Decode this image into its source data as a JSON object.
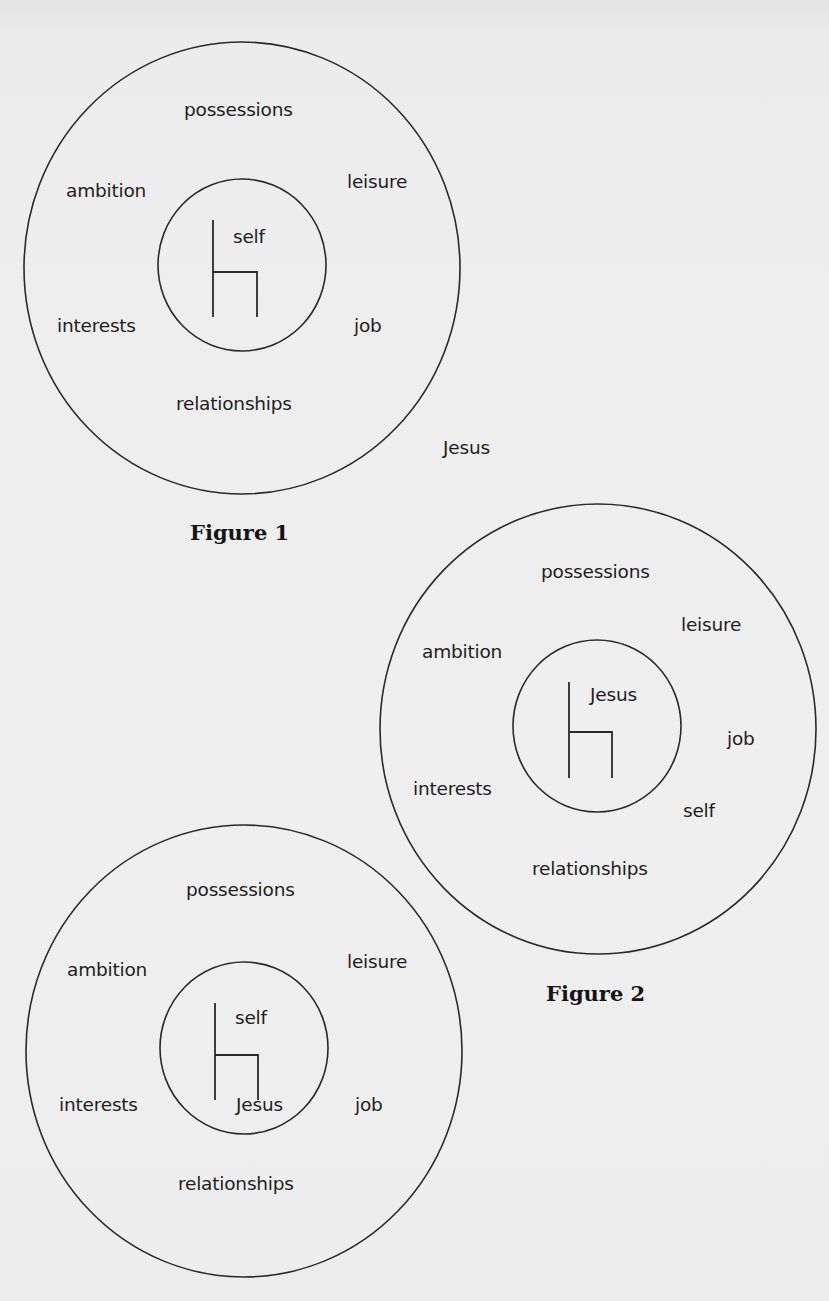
{
  "figures": [
    {
      "caption": "Figure 1",
      "caption_pos": {
        "x": 190,
        "y": 522
      },
      "outer": {
        "cx": 242,
        "cy": 268,
        "rx": 218,
        "ry": 226
      },
      "inner": {
        "cx": 242,
        "cy": 265,
        "rx": 84,
        "ry": 86
      },
      "chair": {
        "x": 213,
        "top": 220,
        "seat": 272,
        "bottom": 317,
        "right": 257
      },
      "throne_label": "self",
      "labels": {
        "possessions": {
          "text": "possessions",
          "x": 184,
          "y": 101
        },
        "ambition": {
          "text": "ambition",
          "x": 66,
          "y": 182
        },
        "leisure": {
          "text": "leisure",
          "x": 347,
          "y": 173
        },
        "throne": {
          "text": "self",
          "x": 233,
          "y": 228
        },
        "interests": {
          "text": "interests",
          "x": 57,
          "y": 317
        },
        "job": {
          "text": "job",
          "x": 354,
          "y": 317
        },
        "relationships": {
          "text": "relationships",
          "x": 176,
          "y": 395
        },
        "outside": {
          "text": "Jesus",
          "x": 443,
          "y": 439
        }
      }
    },
    {
      "caption": "Figure 2",
      "caption_pos": {
        "x": 546,
        "y": 983
      },
      "outer": {
        "cx": 598,
        "cy": 729,
        "rx": 218,
        "ry": 225
      },
      "inner": {
        "cx": 597,
        "cy": 726,
        "rx": 84,
        "ry": 86
      },
      "chair": {
        "x": 569,
        "top": 682,
        "seat": 732,
        "bottom": 778,
        "right": 612
      },
      "throne_label": "Jesus",
      "labels": {
        "possessions": {
          "text": "possessions",
          "x": 541,
          "y": 563
        },
        "leisure": {
          "text": "leisure",
          "x": 681,
          "y": 616
        },
        "ambition": {
          "text": "ambition",
          "x": 422,
          "y": 643
        },
        "throne": {
          "text": "Jesus",
          "x": 590,
          "y": 686
        },
        "job": {
          "text": "job",
          "x": 727,
          "y": 730
        },
        "interests": {
          "text": "interests",
          "x": 413,
          "y": 780
        },
        "self": {
          "text": "self",
          "x": 683,
          "y": 802
        },
        "relationships": {
          "text": "relationships",
          "x": 532,
          "y": 860
        }
      }
    },
    {
      "caption": "",
      "outer": {
        "cx": 244,
        "cy": 1051,
        "rx": 218,
        "ry": 226
      },
      "inner": {
        "cx": 244,
        "cy": 1048,
        "rx": 84,
        "ry": 86
      },
      "chair": {
        "x": 215,
        "top": 1003,
        "seat": 1055,
        "bottom": 1100,
        "right": 258
      },
      "throne_label": "self",
      "labels": {
        "possessions": {
          "text": "possessions",
          "x": 186,
          "y": 881
        },
        "leisure": {
          "text": "leisure",
          "x": 347,
          "y": 953
        },
        "ambition": {
          "text": "ambition",
          "x": 67,
          "y": 961
        },
        "throne": {
          "text": "self",
          "x": 235,
          "y": 1009
        },
        "interests": {
          "text": "interests",
          "x": 59,
          "y": 1096
        },
        "beside_throne": {
          "text": "Jesus",
          "x": 236,
          "y": 1096
        },
        "job": {
          "text": "job",
          "x": 355,
          "y": 1096
        },
        "relationships": {
          "text": "relationships",
          "x": 178,
          "y": 1175
        }
      }
    }
  ],
  "colors": {
    "ink": "#1e1e1e",
    "paper": "#eeeeee"
  }
}
